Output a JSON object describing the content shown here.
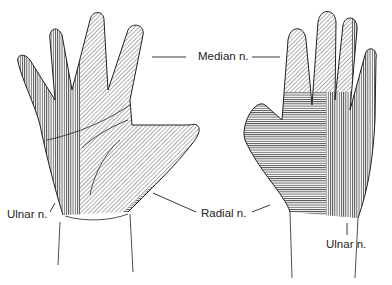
{
  "diagram": {
    "views": [
      "palmar",
      "dorsal"
    ],
    "labels": {
      "median": "Median n.",
      "ulnar_left": "Ulnar n.",
      "radial": "Radial n.",
      "ulnar_right": "Ulnar n."
    },
    "regions": [
      {
        "nerve": "Median n.",
        "pattern": "diagonal hatching",
        "view": "palmar"
      },
      {
        "nerve": "Ulnar n.",
        "pattern": "vertical hatching",
        "view": "palmar"
      },
      {
        "nerve": "Radial n.",
        "pattern": "horizontal hatching",
        "view": "palmar"
      },
      {
        "nerve": "Median n.",
        "pattern": "diagonal hatching",
        "view": "dorsal"
      },
      {
        "nerve": "Radial n.",
        "pattern": "horizontal hatching",
        "view": "dorsal"
      },
      {
        "nerve": "Ulnar n.",
        "pattern": "vertical hatching",
        "view": "dorsal"
      }
    ],
    "colors": {
      "ink": "#222222",
      "background": "#ffffff"
    }
  }
}
